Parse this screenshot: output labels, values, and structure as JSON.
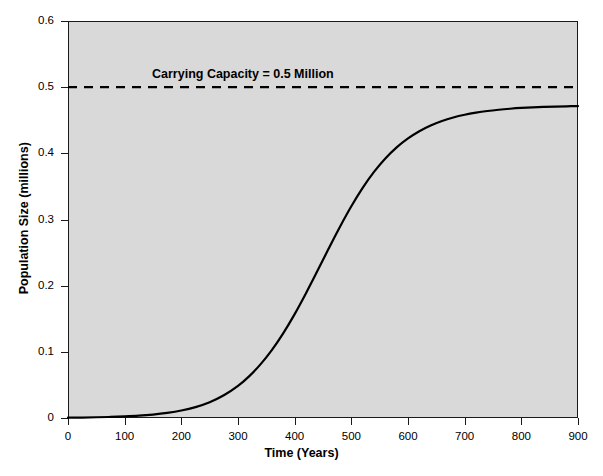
{
  "chart_data": {
    "type": "line",
    "title": "",
    "xlabel": "Time (Years)",
    "ylabel": "Population Size (millions)",
    "xlim": [
      0,
      900
    ],
    "ylim": [
      0,
      0.6
    ],
    "xticks": [
      "0",
      "100",
      "200",
      "300",
      "400",
      "500",
      "600",
      "700",
      "800",
      "900"
    ],
    "xtick_values": [
      0,
      100,
      200,
      300,
      400,
      500,
      600,
      700,
      800,
      900
    ],
    "yticks": [
      "0",
      "0.1",
      "0.2",
      "0.3",
      "0.4",
      "0.5",
      "0.6"
    ],
    "ytick_values": [
      0,
      0.1,
      0.2,
      0.3,
      0.4,
      0.5,
      0.6
    ],
    "grid": false,
    "legend": "none",
    "plot_background_color": "#d9d9d9",
    "line_color": "#000000",
    "annotations": [
      {
        "text": "Carrying Capacity = 0.5 Million",
        "x": 310,
        "y": 0.52
      }
    ],
    "reference_lines": [
      {
        "name": "carrying-capacity",
        "orientation": "horizontal",
        "value": 0.5,
        "style": "dashed",
        "color": "#000000"
      }
    ],
    "series": [
      {
        "name": "Logistic population growth",
        "style": "solid",
        "x": [
          0,
          25,
          50,
          75,
          100,
          125,
          150,
          175,
          200,
          225,
          250,
          275,
          300,
          320,
          340,
          360,
          380,
          400,
          420,
          440,
          460,
          480,
          500,
          520,
          540,
          560,
          580,
          600,
          620,
          640,
          660,
          680,
          700,
          720,
          740,
          760,
          780,
          800,
          820,
          840,
          860,
          880,
          900
        ],
        "y": [
          0.0005,
          0.0007,
          0.0011,
          0.0016,
          0.0024,
          0.0035,
          0.0052,
          0.0077,
          0.0113,
          0.0165,
          0.0239,
          0.0343,
          0.0485,
          0.0633,
          0.0814,
          0.103,
          0.1283,
          0.157,
          0.1886,
          0.222,
          0.256,
          0.2891,
          0.32,
          0.3478,
          0.3719,
          0.3922,
          0.409,
          0.4226,
          0.4335,
          0.4421,
          0.4489,
          0.4542,
          0.4583,
          0.4615,
          0.464,
          0.4659,
          0.4674,
          0.4686,
          0.4695,
          0.4702,
          0.4707,
          0.4711,
          0.4714
        ]
      }
    ]
  },
  "caption_partial": ""
}
